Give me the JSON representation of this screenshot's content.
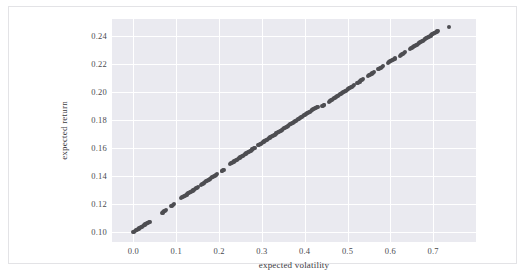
{
  "chart_data": {
    "type": "scatter",
    "title": "",
    "xlabel": "expected volatility",
    "ylabel": "expected return",
    "xlim": [
      -0.05,
      0.8
    ],
    "ylim": [
      0.093,
      0.252
    ],
    "xticks": [
      "0.0",
      "0.1",
      "0.2",
      "0.3",
      "0.4",
      "0.5",
      "0.6",
      "0.7"
    ],
    "xtick_values": [
      0.0,
      0.1,
      0.2,
      0.3,
      0.4,
      0.5,
      0.6,
      0.7
    ],
    "yticks": [
      "0.10",
      "0.12",
      "0.14",
      "0.16",
      "0.18",
      "0.20",
      "0.22",
      "0.24"
    ],
    "ytick_values": [
      0.1,
      0.12,
      0.14,
      0.16,
      0.18,
      0.2,
      0.22,
      0.24
    ],
    "grid": true,
    "grid_color": "#ffffff",
    "plot_background": "#eaeaf0",
    "figure_background": "#ffffff",
    "legend": null,
    "marker_color": "#4d4d52",
    "marker_size": 4,
    "series": [
      {
        "name": "efficient frontier portfolios",
        "x": [
          0.0,
          0.002,
          0.004,
          0.006,
          0.008,
          0.01,
          0.012,
          0.014,
          0.016,
          0.018,
          0.02,
          0.022,
          0.024,
          0.026,
          0.028,
          0.03,
          0.032,
          0.034,
          0.036,
          0.038,
          0.066,
          0.068,
          0.07,
          0.072,
          0.074,
          0.076,
          0.088,
          0.09,
          0.092,
          0.094,
          0.112,
          0.114,
          0.116,
          0.118,
          0.12,
          0.122,
          0.124,
          0.126,
          0.128,
          0.13,
          0.132,
          0.134,
          0.136,
          0.138,
          0.14,
          0.142,
          0.144,
          0.146,
          0.148,
          0.15,
          0.158,
          0.16,
          0.162,
          0.164,
          0.166,
          0.168,
          0.17,
          0.172,
          0.174,
          0.176,
          0.178,
          0.18,
          0.182,
          0.184,
          0.186,
          0.188,
          0.19,
          0.192,
          0.194,
          0.196,
          0.206,
          0.208,
          0.21,
          0.212,
          0.226,
          0.228,
          0.23,
          0.232,
          0.234,
          0.236,
          0.238,
          0.24,
          0.242,
          0.244,
          0.246,
          0.248,
          0.25,
          0.252,
          0.254,
          0.256,
          0.258,
          0.26,
          0.262,
          0.264,
          0.266,
          0.268,
          0.27,
          0.272,
          0.274,
          0.276,
          0.278,
          0.28,
          0.282,
          0.284,
          0.292,
          0.294,
          0.296,
          0.298,
          0.3,
          0.302,
          0.304,
          0.306,
          0.308,
          0.31,
          0.312,
          0.314,
          0.316,
          0.318,
          0.32,
          0.322,
          0.324,
          0.326,
          0.328,
          0.33,
          0.332,
          0.334,
          0.336,
          0.338,
          0.34,
          0.342,
          0.344,
          0.346,
          0.348,
          0.35,
          0.352,
          0.354,
          0.356,
          0.358,
          0.36,
          0.362,
          0.364,
          0.366,
          0.368,
          0.37,
          0.372,
          0.374,
          0.376,
          0.378,
          0.38,
          0.382,
          0.384,
          0.386,
          0.388,
          0.39,
          0.392,
          0.394,
          0.396,
          0.398,
          0.4,
          0.402,
          0.404,
          0.406,
          0.408,
          0.41,
          0.412,
          0.414,
          0.416,
          0.418,
          0.42,
          0.422,
          0.424,
          0.426,
          0.428,
          0.43,
          0.44,
          0.442,
          0.444,
          0.446,
          0.456,
          0.458,
          0.46,
          0.462,
          0.464,
          0.466,
          0.468,
          0.47,
          0.472,
          0.474,
          0.476,
          0.478,
          0.48,
          0.482,
          0.484,
          0.486,
          0.488,
          0.49,
          0.492,
          0.494,
          0.496,
          0.498,
          0.5,
          0.502,
          0.504,
          0.506,
          0.508,
          0.51,
          0.512,
          0.514,
          0.522,
          0.524,
          0.526,
          0.528,
          0.53,
          0.532,
          0.534,
          0.536,
          0.548,
          0.55,
          0.552,
          0.554,
          0.556,
          0.558,
          0.56,
          0.562,
          0.572,
          0.574,
          0.576,
          0.578,
          0.58,
          0.582,
          0.594,
          0.596,
          0.598,
          0.6,
          0.602,
          0.604,
          0.606,
          0.608,
          0.61,
          0.612,
          0.622,
          0.624,
          0.626,
          0.628,
          0.63,
          0.632,
          0.634,
          0.646,
          0.648,
          0.65,
          0.652,
          0.654,
          0.656,
          0.658,
          0.66,
          0.662,
          0.664,
          0.666,
          0.668,
          0.67,
          0.672,
          0.674,
          0.676,
          0.678,
          0.68,
          0.682,
          0.684,
          0.686,
          0.688,
          0.69,
          0.692,
          0.694,
          0.696,
          0.698,
          0.7,
          0.702,
          0.704,
          0.706,
          0.708,
          0.71,
          0.712,
          0.736
        ],
        "y": [
          0.1,
          0.1004,
          0.1008,
          0.1012,
          0.1016,
          0.102,
          0.1024,
          0.1028,
          0.1032,
          0.1036,
          0.104,
          0.1044,
          0.1048,
          0.1052,
          0.1056,
          0.106,
          0.1064,
          0.1068,
          0.1072,
          0.1076,
          0.1136,
          0.114,
          0.1144,
          0.1148,
          0.1152,
          0.1156,
          0.1186,
          0.119,
          0.1194,
          0.1198,
          0.1244,
          0.1248,
          0.1252,
          0.1256,
          0.126,
          0.1264,
          0.1268,
          0.1272,
          0.1276,
          0.128,
          0.1284,
          0.1288,
          0.1292,
          0.1296,
          0.13,
          0.1304,
          0.1308,
          0.1312,
          0.1316,
          0.132,
          0.1338,
          0.1342,
          0.1346,
          0.135,
          0.1354,
          0.1358,
          0.1362,
          0.1366,
          0.137,
          0.1374,
          0.1378,
          0.1382,
          0.1386,
          0.139,
          0.1394,
          0.1398,
          0.1402,
          0.1406,
          0.141,
          0.1414,
          0.1434,
          0.1438,
          0.1442,
          0.1446,
          0.1486,
          0.149,
          0.1494,
          0.1498,
          0.1502,
          0.1506,
          0.151,
          0.1514,
          0.1518,
          0.1522,
          0.1526,
          0.153,
          0.1534,
          0.1538,
          0.1542,
          0.1546,
          0.155,
          0.1554,
          0.1558,
          0.1562,
          0.1566,
          0.157,
          0.1574,
          0.1578,
          0.1582,
          0.1586,
          0.159,
          0.1594,
          0.1598,
          0.1602,
          0.162,
          0.1624,
          0.1628,
          0.1632,
          0.1636,
          0.164,
          0.1644,
          0.1648,
          0.1652,
          0.1656,
          0.166,
          0.1664,
          0.1668,
          0.1672,
          0.1676,
          0.168,
          0.1684,
          0.1688,
          0.1692,
          0.1696,
          0.17,
          0.1704,
          0.1708,
          0.1712,
          0.1716,
          0.172,
          0.1724,
          0.1728,
          0.1732,
          0.1736,
          0.174,
          0.1744,
          0.1748,
          0.1752,
          0.1756,
          0.176,
          0.1764,
          0.1768,
          0.1772,
          0.1776,
          0.178,
          0.1784,
          0.1788,
          0.1792,
          0.1796,
          0.18,
          0.1804,
          0.1808,
          0.1812,
          0.1816,
          0.182,
          0.1824,
          0.1828,
          0.1832,
          0.1836,
          0.184,
          0.1844,
          0.1848,
          0.1852,
          0.1856,
          0.186,
          0.1864,
          0.1868,
          0.1872,
          0.1876,
          0.188,
          0.1884,
          0.1888,
          0.1892,
          0.1896,
          0.1898,
          0.1902,
          0.1906,
          0.191,
          0.193,
          0.1934,
          0.1938,
          0.1942,
          0.1946,
          0.195,
          0.1954,
          0.1958,
          0.1962,
          0.1966,
          0.197,
          0.1974,
          0.1978,
          0.1982,
          0.1986,
          0.199,
          0.1994,
          0.1998,
          0.2002,
          0.2006,
          0.201,
          0.2014,
          0.2018,
          0.2022,
          0.2026,
          0.203,
          0.2034,
          0.2038,
          0.2042,
          0.2046,
          0.2062,
          0.2066,
          0.207,
          0.2074,
          0.2078,
          0.2082,
          0.2086,
          0.209,
          0.2114,
          0.2118,
          0.2122,
          0.2126,
          0.213,
          0.2134,
          0.2138,
          0.2142,
          0.2162,
          0.2166,
          0.217,
          0.2174,
          0.2178,
          0.2182,
          0.2206,
          0.221,
          0.2214,
          0.2218,
          0.2222,
          0.2226,
          0.223,
          0.2234,
          0.2238,
          0.2242,
          0.2258,
          0.2262,
          0.2266,
          0.227,
          0.2274,
          0.2278,
          0.2282,
          0.2306,
          0.231,
          0.2314,
          0.2318,
          0.2322,
          0.2326,
          0.233,
          0.2334,
          0.2338,
          0.2342,
          0.2346,
          0.235,
          0.2354,
          0.2358,
          0.2362,
          0.2366,
          0.237,
          0.2374,
          0.2378,
          0.2382,
          0.2386,
          0.239,
          0.2394,
          0.2398,
          0.2402,
          0.2406,
          0.241,
          0.2414,
          0.2418,
          0.2422,
          0.2426,
          0.243,
          0.2434,
          0.2438,
          0.2465
        ]
      }
    ]
  }
}
